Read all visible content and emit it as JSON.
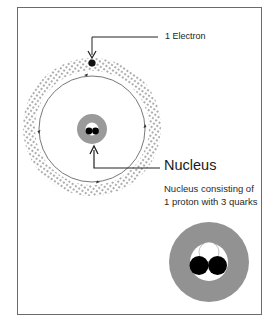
{
  "diagram": {
    "labels": {
      "electron": "1 Electron",
      "nucleus": "Nucleus",
      "nucleus_description_line1": "Nucleus consisting of",
      "nucleus_description_line2": "1 proton with 3 quarks"
    },
    "colors": {
      "frame_border": "#6b6b6b",
      "nucleus_shell": "#9a9a9a",
      "quark_dark": "#000000",
      "quark_light": "#ffffff",
      "orbit_line": "#555555",
      "dots": "#333333"
    },
    "components": [
      {
        "name": "electron",
        "count": 1
      },
      {
        "name": "proton",
        "count": 1
      },
      {
        "name": "quarks",
        "count": 3
      }
    ]
  }
}
